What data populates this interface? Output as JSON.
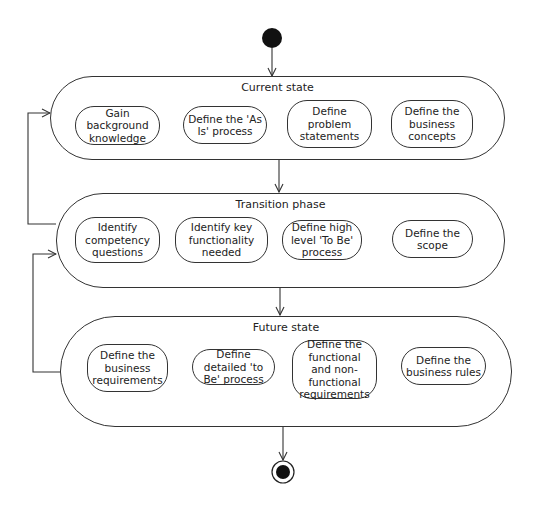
{
  "diagram": {
    "type": "UML activity diagram",
    "regions": [
      {
        "id": "current",
        "title": "Current state",
        "actions": [
          {
            "label": "Gain background knowledge"
          },
          {
            "label": "Define the 'As Is' process"
          },
          {
            "label": "Define problem statements"
          },
          {
            "label": "Define the business concepts"
          }
        ]
      },
      {
        "id": "transition",
        "title": "Transition phase",
        "actions": [
          {
            "label": "Identify competency questions"
          },
          {
            "label": "Identify key functionality needed"
          },
          {
            "label": "Define high level 'To Be' process"
          },
          {
            "label": "Define the scope"
          }
        ]
      },
      {
        "id": "future",
        "title": "Future state",
        "actions": [
          {
            "label": "Define the business requirements"
          },
          {
            "label": "Define detailed 'to Be' process"
          },
          {
            "label": "Define the functional and non-functional requirements"
          },
          {
            "label": "Define the business rules"
          }
        ]
      }
    ],
    "flows": [
      {
        "from": "initial",
        "to": "Current state"
      },
      {
        "from": "Gain background knowledge",
        "to": "Define the 'As Is' process"
      },
      {
        "from": "Define the 'As Is' process",
        "to": "Define problem statements"
      },
      {
        "from": "Define problem statements",
        "to": "Define the business concepts"
      },
      {
        "from": "Current state",
        "to": "Transition phase"
      },
      {
        "from": "Transition phase",
        "to": "Current state"
      },
      {
        "from": "Identify key functionality needed",
        "to": "Define high level 'To Be' process"
      },
      {
        "from": "Define high level 'To Be' process",
        "to": "Identify key functionality needed"
      },
      {
        "from": "Define high level 'To Be' process",
        "to": "Define the scope"
      },
      {
        "from": "Transition phase",
        "to": "Future state"
      },
      {
        "from": "Future state",
        "to": "Transition phase"
      },
      {
        "from": "Define the business requirements",
        "to": "Define detailed 'to Be' process"
      },
      {
        "from": "Define detailed 'to Be' process",
        "to": "Define the functional and non-functional requirements"
      },
      {
        "from": "Define the functional and non-functional requirements",
        "to": "Define detailed 'to Be' process"
      },
      {
        "from": "Future state",
        "to": "final"
      }
    ],
    "colors": {
      "stroke": "#333333",
      "fill": "#ffffff",
      "node": "#111111"
    }
  }
}
